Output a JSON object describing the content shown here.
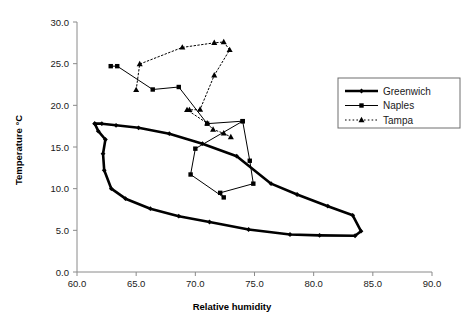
{
  "chart_data": {
    "type": "scatter",
    "title": "",
    "xlabel": "Relative humidity",
    "ylabel": "Temperature °C",
    "xlim": [
      60.0,
      90.0
    ],
    "ylim": [
      0.0,
      30.0
    ],
    "xticks": [
      "60.0",
      "65.0",
      "70.0",
      "75.0",
      "80.0",
      "85.0",
      "90.0"
    ],
    "yticks": [
      "0.0",
      "5.0",
      "10.0",
      "15.0",
      "20.0",
      "25.0",
      "30.0"
    ],
    "xtick_values": [
      60,
      65,
      70,
      75,
      80,
      85,
      90
    ],
    "ytick_values": [
      0,
      5,
      10,
      15,
      20,
      25,
      30
    ],
    "grid": false,
    "legend_position": "upper right",
    "series": [
      {
        "name": "Greenwich",
        "marker": "diamond",
        "linestyle": "solid",
        "linewidth": 2.6,
        "color": "#000000",
        "points": [
          [
            61.5,
            17.8
          ],
          [
            62.1,
            17.8
          ],
          [
            63.3,
            17.6
          ],
          [
            65.2,
            17.3
          ],
          [
            67.8,
            16.6
          ],
          [
            70.6,
            15.4
          ],
          [
            73.5,
            13.9
          ],
          [
            76.4,
            10.6
          ],
          [
            78.6,
            9.3
          ],
          [
            81.2,
            7.9
          ],
          [
            83.3,
            6.8
          ],
          [
            84.0,
            4.9
          ],
          [
            83.5,
            4.35
          ],
          [
            80.5,
            4.4
          ],
          [
            78.0,
            4.5
          ],
          [
            74.5,
            5.1
          ],
          [
            71.2,
            6.0
          ],
          [
            68.6,
            6.7
          ],
          [
            66.2,
            7.6
          ],
          [
            64.1,
            8.8
          ],
          [
            62.9,
            10.0
          ],
          [
            62.3,
            12.2
          ],
          [
            62.2,
            14.2
          ],
          [
            62.4,
            15.9
          ],
          [
            61.8,
            16.9
          ],
          [
            61.5,
            17.8
          ]
        ]
      },
      {
        "name": "Naples",
        "marker": "square",
        "linestyle": "solid",
        "linewidth": 1,
        "color": "#000000",
        "points": [
          [
            62.85,
            24.7
          ],
          [
            63.4,
            24.7
          ],
          [
            66.4,
            21.9
          ],
          [
            68.6,
            22.2
          ],
          [
            71.0,
            17.8
          ],
          [
            74.0,
            18.1
          ],
          [
            74.6,
            13.35
          ],
          [
            74.9,
            10.6
          ],
          [
            72.1,
            9.5
          ],
          [
            72.4,
            8.95
          ],
          [
            69.6,
            11.7
          ],
          [
            70.0,
            14.8
          ],
          [
            74.0,
            18.1
          ]
        ]
      },
      {
        "name": "Tampa",
        "marker": "triangle",
        "linestyle": "dotted",
        "linewidth": 1,
        "color": "#000000",
        "points": [
          [
            65.0,
            21.85
          ],
          [
            65.3,
            24.95
          ],
          [
            68.9,
            26.95
          ],
          [
            71.6,
            27.5
          ],
          [
            72.4,
            27.6
          ],
          [
            72.9,
            26.65
          ],
          [
            71.6,
            23.6
          ],
          [
            70.4,
            19.5
          ],
          [
            69.5,
            19.45
          ],
          [
            69.3,
            19.45
          ],
          [
            71.0,
            17.85
          ],
          [
            71.5,
            17.1
          ],
          [
            72.4,
            16.65
          ],
          [
            73.0,
            16.2
          ]
        ]
      }
    ]
  },
  "legend": {
    "items": [
      {
        "label": "Greenwich"
      },
      {
        "label": "Naples"
      },
      {
        "label": "Tampa"
      }
    ]
  }
}
